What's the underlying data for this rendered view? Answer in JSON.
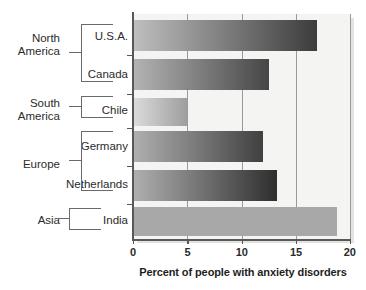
{
  "chart_data": {
    "type": "bar",
    "orientation": "horizontal",
    "title": "",
    "xlabel": "Percent of people with anxiety disorders",
    "ylabel": "",
    "xlim": [
      0,
      20
    ],
    "xticks": [
      0,
      5,
      10,
      15,
      20
    ],
    "xtick_labels": [
      "0",
      "5",
      "10",
      "15",
      "20"
    ],
    "grid": true,
    "grid_axis": "x",
    "legend": false,
    "categories": [
      "U.S.A.",
      "Canada",
      "Chile",
      "Germany",
      "Netherlands",
      "India"
    ],
    "values": [
      17.0,
      12.5,
      5.0,
      12.0,
      13.3,
      18.8
    ],
    "groups": [
      {
        "label": "North America",
        "label_lines": [
          "North",
          "America"
        ],
        "countries": [
          "U.S.A.",
          "Canada"
        ]
      },
      {
        "label": "South America",
        "label_lines": [
          "South",
          "America"
        ],
        "countries": [
          "Chile"
        ]
      },
      {
        "label": "Europe",
        "label_lines": [
          "Europe"
        ],
        "countries": [
          "Germany",
          "Netherlands"
        ]
      },
      {
        "label": "Asia",
        "label_lines": [
          "Asia"
        ],
        "countries": [
          "India"
        ]
      }
    ],
    "bars": [
      {
        "country": "U.S.A.",
        "value": 17.0,
        "fill": "gradient",
        "from": "#bfbfbf",
        "to": "#3c3c3c"
      },
      {
        "country": "Canada",
        "value": 12.5,
        "fill": "gradient",
        "from": "#b4b4b4",
        "to": "#464646"
      },
      {
        "country": "Chile",
        "value": 5.0,
        "fill": "gradient",
        "from": "#dcdcdc",
        "to": "#9e9e9e"
      },
      {
        "country": "Germany",
        "value": 12.0,
        "fill": "gradient",
        "from": "#b0b0b0",
        "to": "#404040"
      },
      {
        "country": "Netherlands",
        "value": 13.3,
        "fill": "gradient",
        "from": "#b0b0b0",
        "to": "#2e2e2e"
      },
      {
        "country": "India",
        "value": 18.8,
        "fill": "solid",
        "from": "#a8a8a8",
        "to": "#a8a8a8"
      }
    ]
  },
  "axis": {
    "x_title": "Percent of people with anxiety disorders",
    "tick_0": "0",
    "tick_5": "5",
    "tick_10": "10",
    "tick_15": "15",
    "tick_20": "20"
  },
  "labels": {
    "usa": "U.S.A.",
    "canada": "Canada",
    "chile": "Chile",
    "germany": "Germany",
    "netherlands": "Netherlands",
    "india": "India",
    "north_1": "North",
    "north_2": "America",
    "south_1": "South",
    "south_2": "America",
    "europe": "Europe",
    "asia": "Asia"
  },
  "colors": {
    "plot_background": "#f4f4f2",
    "axis": "#58585a",
    "gridline": "#9a9a9a",
    "text": "#2b2b2b",
    "bracket": "#6a6a6a"
  }
}
